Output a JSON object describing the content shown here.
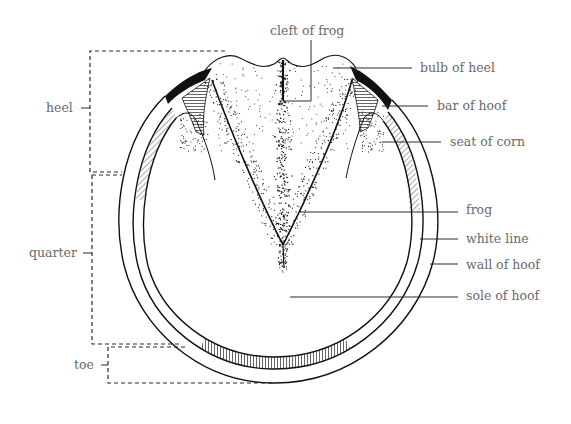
{
  "labels": {
    "cleft_of_frog": "cleft of frog",
    "bulb_of_heel": "bulb of heel",
    "bar_of_hoof": "bar of hoof",
    "seat_of_corn": "seat of corn",
    "frog": "frog",
    "white_line": "white line",
    "wall_of_hoof": "wall of hoof",
    "sole_of_hoof": "sole of hoof"
  },
  "regions": {
    "heel": "heel",
    "quarter": "quarter",
    "toe": "toe"
  },
  "colors": {
    "ink": "#111111",
    "label_text": "#6a6a6a",
    "background": "#ffffff"
  }
}
